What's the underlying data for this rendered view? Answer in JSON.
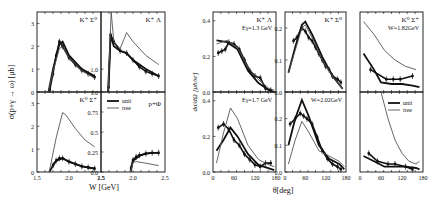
{
  "figure": {
    "left_block": {
      "ylabel": "σ(p+γ → ω) [μb]",
      "xlabel": "W [GeV]",
      "xticks": [
        "1.5",
        "2.0",
        "2.5"
      ]
    },
    "right_block": {
      "ylabel": "dσ/dΩ [μb/sr]",
      "xlabel": "θ[deg]",
      "xticks": [
        "0",
        "60",
        "120",
        "180"
      ]
    },
    "legend": {
      "unit": "unit",
      "tree": "tree"
    }
  },
  "chart_data": [
    {
      "type": "line",
      "panel": "top-left",
      "label": "K⁺ Σ⁰",
      "xlabel": "W [GeV]",
      "ylabel": "σ [μb]",
      "xlim": [
        1.5,
        2.5
      ],
      "ylim": [
        0,
        3.5
      ],
      "yticks": [
        "0",
        "1",
        "2",
        "3"
      ],
      "series": [
        {
          "name": "data",
          "x": [
            1.7,
            1.75,
            1.8,
            1.85,
            1.9,
            2.0,
            2.1,
            2.2,
            2.3,
            2.4
          ],
          "y": [
            0.1,
            0.8,
            1.6,
            2.2,
            2.0,
            1.5,
            1.2,
            0.95,
            0.8,
            0.65
          ]
        },
        {
          "name": "unit",
          "x": [
            1.68,
            1.75,
            1.85,
            1.9,
            2.0,
            2.2,
            2.4
          ],
          "y": [
            0,
            1.0,
            2.1,
            2.2,
            1.6,
            1.0,
            0.7
          ]
        },
        {
          "name": "tree",
          "x": [
            1.68,
            1.75,
            1.85,
            1.9,
            2.0,
            2.2,
            2.4
          ],
          "y": [
            0,
            0.9,
            1.9,
            2.0,
            1.5,
            0.95,
            0.6
          ]
        }
      ]
    },
    {
      "type": "line",
      "panel": "top-right",
      "label": "K⁺ Λ",
      "xlabel": "W [GeV]",
      "ylabel": "σ [μb]",
      "xlim": [
        1.5,
        2.5
      ],
      "ylim": [
        0,
        3.5
      ],
      "yticks": [
        "1.0"
      ],
      "series": [
        {
          "name": "data",
          "x": [
            1.62,
            1.65,
            1.7,
            1.8,
            1.9,
            2.0,
            2.1,
            2.2,
            2.3,
            2.4
          ],
          "y": [
            0.2,
            2.5,
            2.2,
            1.8,
            1.7,
            1.4,
            1.1,
            0.9,
            0.8,
            0.7
          ]
        },
        {
          "name": "unit",
          "x": [
            1.61,
            1.65,
            1.7,
            1.8,
            1.9,
            2.0,
            2.2,
            2.4
          ],
          "y": [
            0,
            2.5,
            2.0,
            1.8,
            1.7,
            1.4,
            1.0,
            0.7
          ]
        },
        {
          "name": "tree",
          "x": [
            1.61,
            1.66,
            1.7,
            1.8,
            1.9,
            2.0,
            2.2,
            2.4
          ],
          "y": [
            0,
            3.5,
            2.2,
            1.9,
            2.6,
            2.2,
            1.6,
            1.2
          ]
        }
      ]
    },
    {
      "type": "line",
      "panel": "bottom-left",
      "label": "K⁰ Σ⁺",
      "xlabel": "W [GeV]",
      "ylabel": "σ [μb]",
      "xlim": [
        1.5,
        2.5
      ],
      "ylim": [
        0,
        3.5
      ],
      "yticks": [
        "0",
        "1",
        "2",
        "3"
      ],
      "series": [
        {
          "name": "data",
          "x": [
            1.75,
            1.8,
            1.85,
            1.9,
            2.0,
            2.1,
            2.2,
            2.3,
            2.4
          ],
          "y": [
            0.3,
            0.5,
            0.6,
            0.6,
            0.45,
            0.35,
            0.25,
            0.2,
            0.15
          ]
        },
        {
          "name": "unit",
          "x": [
            1.69,
            1.8,
            1.9,
            2.0,
            2.2,
            2.4
          ],
          "y": [
            0,
            0.5,
            0.6,
            0.45,
            0.25,
            0.15
          ]
        },
        {
          "name": "tree",
          "x": [
            1.69,
            1.8,
            1.9,
            1.95,
            2.1,
            2.25,
            2.4
          ],
          "y": [
            0,
            1.5,
            2.6,
            2.5,
            1.9,
            1.4,
            1.1
          ]
        }
      ]
    },
    {
      "type": "line",
      "panel": "bottom-right",
      "label": "p+Φ",
      "xlabel": "W [GeV]",
      "ylabel": "σ [μb]",
      "xlim": [
        1.5,
        2.5
      ],
      "ylim": [
        0,
        1.0
      ],
      "yticks": [
        "0.0",
        "0.25",
        "0.5",
        "0.75",
        "1.0"
      ],
      "series": [
        {
          "name": "data",
          "x": [
            1.97,
            2.0,
            2.05,
            2.1,
            2.2,
            2.3,
            2.4
          ],
          "y": [
            0.05,
            0.15,
            0.19,
            0.21,
            0.23,
            0.24,
            0.24
          ]
        },
        {
          "name": "unit",
          "x": [
            1.96,
            2.0,
            2.1,
            2.2,
            2.3,
            2.4
          ],
          "y": [
            0,
            0.14,
            0.2,
            0.23,
            0.24,
            0.24
          ]
        },
        {
          "name": "tree",
          "x": [
            1.96,
            2.0,
            2.05,
            2.2,
            2.4
          ],
          "y": [
            0,
            0.12,
            0.13,
            0.11,
            0.08
          ]
        }
      ]
    },
    {
      "type": "line",
      "panel": "angular-1-top",
      "label": "K⁺ Λ",
      "sublabel": "Eγ=1.3 GeV",
      "xlabel": "θ[deg]",
      "ylabel": "dσ/dΩ [μb/sr]",
      "xlim": [
        0,
        180
      ],
      "ylim": [
        0,
        0.45
      ],
      "yticks": [
        "0.0",
        "0.2",
        "0.4"
      ],
      "series": [
        {
          "name": "data",
          "x": [
            15,
            25,
            35,
            45,
            60,
            75,
            90,
            105,
            120,
            135,
            150,
            165
          ],
          "y": [
            0.22,
            0.23,
            0.24,
            0.28,
            0.27,
            0.24,
            0.18,
            0.12,
            0.09,
            0.08,
            0.02,
            0.01
          ]
        },
        {
          "name": "unit",
          "x": [
            10,
            40,
            70,
            100,
            130,
            160,
            175
          ],
          "y": [
            0.29,
            0.28,
            0.24,
            0.12,
            0.05,
            0.01,
            0.0
          ]
        },
        {
          "name": "tree",
          "x": [
            10,
            40,
            70,
            100,
            130,
            160,
            175
          ],
          "y": [
            0.27,
            0.29,
            0.25,
            0.14,
            0.07,
            0.02,
            0.01
          ]
        }
      ]
    },
    {
      "type": "line",
      "panel": "angular-1-bottom",
      "label": "",
      "sublabel": "Eγ=1.7 GeV",
      "xlabel": "θ[deg]",
      "ylabel": "dσ/dΩ [μb/sr]",
      "xlim": [
        0,
        180
      ],
      "ylim": [
        0,
        0.45
      ],
      "yticks": [
        "0.0",
        "0.2",
        "0.4"
      ],
      "series": [
        {
          "name": "data",
          "x": [
            15,
            30,
            45,
            60,
            75,
            90,
            105,
            120,
            135,
            150,
            165
          ],
          "y": [
            0.25,
            0.27,
            0.24,
            0.18,
            0.15,
            0.1,
            0.07,
            0.04,
            0.03,
            0.05,
            0.05
          ]
        },
        {
          "name": "unit",
          "x": [
            10,
            30,
            50,
            70,
            100,
            130,
            160,
            175
          ],
          "y": [
            0.12,
            0.18,
            0.25,
            0.2,
            0.1,
            0.04,
            0.02,
            0.01
          ]
        },
        {
          "name": "tree",
          "x": [
            10,
            30,
            50,
            70,
            100,
            130,
            160,
            175
          ],
          "y": [
            0.05,
            0.22,
            0.36,
            0.3,
            0.15,
            0.07,
            0.04,
            0.03
          ]
        }
      ]
    },
    {
      "type": "line",
      "panel": "angular-2-top",
      "label": "K⁺ Σ⁰",
      "sublabel": "",
      "xlabel": "θ[deg]",
      "ylabel": "dσ/dΩ [μb/sr]",
      "xlim": [
        0,
        180
      ],
      "ylim": [
        0,
        0.25
      ],
      "yticks": [
        "0.0",
        "0.1",
        "0.2"
      ],
      "series": [
        {
          "name": "data",
          "x": [
            25,
            35,
            50,
            60,
            70,
            80,
            90,
            100,
            110,
            120,
            130,
            140,
            155,
            165
          ],
          "y": [
            0.16,
            0.17,
            0.2,
            0.19,
            0.17,
            0.16,
            0.14,
            0.12,
            0.1,
            0.08,
            0.07,
            0.05,
            0.04,
            0.03
          ]
        },
        {
          "name": "unit",
          "x": [
            10,
            30,
            50,
            60,
            80,
            110,
            140,
            170
          ],
          "y": [
            0.06,
            0.14,
            0.21,
            0.22,
            0.18,
            0.11,
            0.05,
            0.01
          ]
        },
        {
          "name": "tree",
          "x": [
            10,
            30,
            50,
            60,
            80,
            110,
            140,
            170
          ],
          "y": [
            0.06,
            0.13,
            0.2,
            0.21,
            0.17,
            0.1,
            0.05,
            0.01
          ]
        }
      ]
    },
    {
      "type": "line",
      "panel": "angular-2-bottom",
      "label": "",
      "sublabel": "W=2.02GeV",
      "xlabel": "θ[deg]",
      "ylabel": "dσ/dΩ [μb/sr]",
      "xlim": [
        0,
        180
      ],
      "ylim": [
        0,
        0.3
      ],
      "yticks": [
        "0.0",
        "0.1",
        "0.2"
      ],
      "series": [
        {
          "name": "data",
          "x": [
            15,
            30,
            45,
            55,
            65,
            80,
            95,
            110,
            125,
            140,
            155,
            165
          ],
          "y": [
            0.18,
            0.2,
            0.22,
            0.21,
            0.2,
            0.18,
            0.13,
            0.08,
            0.05,
            0.03,
            0.02,
            0.01
          ]
        },
        {
          "name": "unit",
          "x": [
            10,
            30,
            50,
            70,
            100,
            130,
            160,
            175
          ],
          "y": [
            0.1,
            0.2,
            0.27,
            0.21,
            0.1,
            0.05,
            0.03,
            0.01
          ]
        },
        {
          "name": "tree",
          "x": [
            10,
            30,
            50,
            70,
            100,
            130,
            160,
            175
          ],
          "y": [
            0.03,
            0.12,
            0.19,
            0.15,
            0.08,
            0.06,
            0.04,
            0.02
          ]
        }
      ]
    },
    {
      "type": "line",
      "panel": "angular-3-top",
      "label": "K⁰ Σ⁺",
      "sublabel": "W=1.82GeV",
      "xlabel": "θ[deg]",
      "ylabel": "dσ/dΩ [μb/sr]",
      "xlim": [
        0,
        180
      ],
      "ylim": [
        0,
        0.25
      ],
      "yticks": [],
      "series": [
        {
          "name": "data",
          "x": [
            30,
            75,
            95,
            115,
            150
          ],
          "y": [
            0.07,
            0.04,
            0.04,
            0.04,
            0.05
          ]
        },
        {
          "name": "unit",
          "x": [
            10,
            40,
            60,
            90,
            120,
            150,
            170
          ],
          "y": [
            0.12,
            0.07,
            0.03,
            0.025,
            0.025,
            0.02,
            0.015
          ]
        },
        {
          "name": "tree",
          "x": [
            10,
            40,
            70,
            100,
            130,
            160
          ],
          "y": [
            0.22,
            0.18,
            0.13,
            0.1,
            0.08,
            0.07
          ]
        }
      ]
    },
    {
      "type": "line",
      "panel": "angular-3-bottom",
      "label": "",
      "sublabel": "",
      "xlabel": "θ[deg]",
      "ylabel": "dσ/dΩ [μb/sr]",
      "xlim": [
        0,
        180
      ],
      "ylim": [
        0,
        0.3
      ],
      "yticks": [],
      "legend": [
        "unit",
        "tree"
      ],
      "series": [
        {
          "name": "data",
          "x": [
            25,
            50,
            80,
            100,
            130,
            150
          ],
          "y": [
            0.07,
            0.04,
            0.03,
            0.03,
            0.02,
            0.01
          ]
        },
        {
          "name": "unit",
          "x": [
            10,
            40,
            70,
            100,
            130,
            160,
            170
          ],
          "y": [
            0.06,
            0.04,
            0.02,
            0.02,
            0.02,
            0.015,
            0.01
          ]
        },
        {
          "name": "tree",
          "x": [
            60,
            80,
            100,
            120,
            140,
            160,
            170
          ],
          "y": [
            0.3,
            0.2,
            0.12,
            0.07,
            0.04,
            0.03,
            0.04
          ]
        }
      ]
    }
  ]
}
